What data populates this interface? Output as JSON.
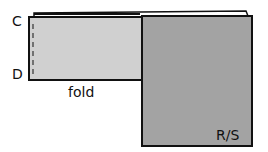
{
  "diagram": {
    "labels": {
      "top_left": "C",
      "bottom_left": "D",
      "fold": "fold",
      "right_panel": "R/S"
    },
    "colors": {
      "light_panel": "#d0d0d0",
      "dark_panel": "#a3a3a3",
      "stroke": "#111111",
      "background": "#ffffff"
    }
  }
}
